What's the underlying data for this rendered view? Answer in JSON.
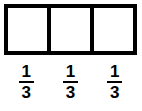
{
  "figure": {
    "type": "fraction-bar-model",
    "background_color": "#ffffff",
    "line_color": "#000000",
    "total_parts": 3,
    "shaded_parts": 0
  },
  "bar_model": {
    "cells": [
      {
        "shaded": false
      },
      {
        "shaded": false
      },
      {
        "shaded": false
      }
    ]
  },
  "labels": [
    {
      "numerator": "1",
      "denominator": "3"
    },
    {
      "numerator": "1",
      "denominator": "3"
    },
    {
      "numerator": "1",
      "denominator": "3"
    }
  ]
}
